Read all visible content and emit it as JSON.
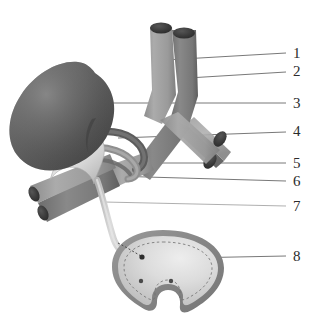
{
  "figure": {
    "background_color": "#ffffff",
    "width": 319,
    "height": 328,
    "label_color": "#2b2b2b",
    "leader_line_color": "#555555"
  },
  "palette": {
    "kidney_dark": "#4a4a4a",
    "kidney_mid": "#6e6e6e",
    "kidney_light": "#8f8f8f",
    "vessel_light": "#9c9c9c",
    "vessel_dark": "#7b7b7b",
    "vessel_cut_end": "#3f3f3f",
    "ureter_light": "#cfcfcf",
    "ureter_mid": "#b5b5b5",
    "bladder_wall": "#8a8a8a",
    "bladder_fill": "#d6d6d6",
    "bladder_highlight": "#ebebeb",
    "outline": "#5a5a5a"
  },
  "labels": [
    {
      "id": "1",
      "text": "1",
      "x": 298,
      "y": 58,
      "leader_x1": 165,
      "leader_y1": 60,
      "leader_x2": 286,
      "leader_y2": 53,
      "target": "left-vertical-vessel"
    },
    {
      "id": "2",
      "text": "2",
      "x": 298,
      "y": 76,
      "leader_x1": 188,
      "leader_y1": 78,
      "leader_x2": 286,
      "leader_y2": 72,
      "target": "right-vertical-vessel"
    },
    {
      "id": "3",
      "text": "3",
      "x": 298,
      "y": 108,
      "leader_x1": 108,
      "leader_y1": 103,
      "leader_x2": 286,
      "leader_y2": 103,
      "target": "kidney"
    },
    {
      "id": "4",
      "text": "4",
      "x": 298,
      "y": 136,
      "leader_x1": 118,
      "leader_y1": 138,
      "leader_x2": 286,
      "leader_y2": 132,
      "target": "renal-artery"
    },
    {
      "id": "5",
      "text": "5",
      "x": 298,
      "y": 168,
      "leader_x1": 126,
      "leader_y1": 163,
      "leader_x2": 286,
      "leader_y2": 163,
      "target": "renal-vein"
    },
    {
      "id": "6",
      "text": "6",
      "x": 298,
      "y": 186,
      "leader_x1": 112,
      "leader_y1": 176,
      "leader_x2": 286,
      "leader_y2": 181,
      "target": "renal-pelvis"
    },
    {
      "id": "7",
      "text": "7",
      "x": 298,
      "y": 211,
      "leader_x1": 104,
      "leader_y1": 202,
      "leader_x2": 286,
      "leader_y2": 206,
      "target": "ureter"
    },
    {
      "id": "8",
      "text": "8",
      "x": 298,
      "y": 261,
      "leader_x1": 185,
      "leader_y1": 258,
      "leader_x2": 286,
      "leader_y2": 256,
      "target": "urinary-bladder"
    }
  ],
  "structures": {
    "kidney": {
      "name": "kidney",
      "cx": 78,
      "cy": 102
    },
    "left_vertical_vessel": {
      "name": "inferior-vena-cava"
    },
    "right_vertical_vessel": {
      "name": "abdominal-aorta"
    },
    "renal_artery": {
      "name": "renal-artery"
    },
    "renal_vein": {
      "name": "renal-vein"
    },
    "renal_pelvis": {
      "name": "renal-pelvis"
    },
    "ureter": {
      "name": "ureter"
    },
    "bladder": {
      "name": "urinary-bladder",
      "cx": 163,
      "cy": 272
    },
    "bladder_orifices": [
      {
        "x": 142,
        "y": 257
      },
      {
        "x": 141,
        "y": 281
      },
      {
        "x": 171,
        "y": 281
      }
    ],
    "lower_left_vessels": {
      "name": "iliac-vessels-left"
    },
    "lower_right_vessels": {
      "name": "iliac-vessels-right"
    }
  }
}
